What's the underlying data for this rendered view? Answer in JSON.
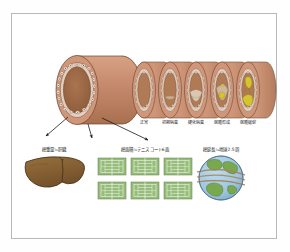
{
  "document": {
    "title": "血管の進展段階と全身血管の規模比較",
    "background_color": "#ffffff",
    "frame_color": "#b9b9b9"
  },
  "main_vessel": {
    "name": "正常血管（三次元断面）",
    "wall_color": "#c98e72",
    "wall_shadow_color": "#a9704f",
    "lumen_color": "#9a6442",
    "endothelium_cell_color": "#e8d9cf",
    "outline_color": "#6b4530"
  },
  "progression": {
    "stages": [
      {
        "label": "正常",
        "plaque": "none"
      },
      {
        "label": "初期病変",
        "plaque": "none"
      },
      {
        "label": "硬化病変",
        "plaque": "fibrous"
      },
      {
        "label": "粥腫形成",
        "plaque": "atheroma"
      },
      {
        "label": "粥腫破綻",
        "plaque": "ruptured"
      }
    ],
    "plaque_color": "#d4c52e",
    "fibrous_color": "#d9c7b4"
  },
  "comparisons": [
    {
      "label": "総重量≒肝臓",
      "icon": "liver-illustration",
      "color": "#8a6334"
    },
    {
      "label": "総面積≒テニスコート6面",
      "icon": "tennis-court-grid",
      "color": "#96bd79",
      "court_count": 6,
      "court_line_color": "#ffffff"
    },
    {
      "label": "総延長≒地球2.5周",
      "icon": "globe-illustration",
      "ocean_color": "#9ec6e0",
      "land_color": "#7aa84f",
      "wrap_color": "#b08a5e"
    }
  ],
  "arrows": {
    "color": "#1a1a1a",
    "count": 3
  }
}
